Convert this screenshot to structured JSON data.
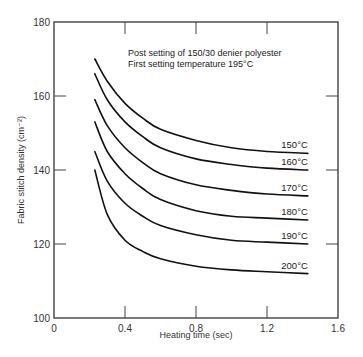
{
  "chart_data": {
    "type": "line",
    "title": "",
    "annotations": [
      "Post setting of 150/30 denier polyester",
      "First setting temperature 195°C"
    ],
    "xlabel": "Heating time (sec)",
    "ylabel": "Fabric stitch density (cm⁻²)",
    "xlim": [
      0,
      1.6
    ],
    "ylim": [
      100,
      180
    ],
    "xticks": [
      0,
      0.4,
      0.8,
      1.2,
      1.6
    ],
    "xtick_labels": [
      "0",
      "0.4",
      "0.8",
      "1.2",
      "1.6"
    ],
    "yticks": [
      100,
      120,
      140,
      160,
      180
    ],
    "ytick_labels": [
      "100",
      "120",
      "140",
      "160",
      "180"
    ],
    "grid": false,
    "legend": "inline labels at right end of each curve",
    "x": [
      0.23,
      0.3,
      0.4,
      0.5,
      0.6,
      0.8,
      1.0,
      1.2,
      1.43
    ],
    "series": [
      {
        "name": "150°C",
        "values": [
          170,
          164,
          158,
          154,
          151,
          148,
          146,
          145,
          144.5
        ]
      },
      {
        "name": "160°C",
        "values": [
          166,
          159,
          153,
          149,
          146,
          143,
          141.5,
          140.5,
          140
        ]
      },
      {
        "name": "170°C",
        "values": [
          159,
          152,
          146,
          142,
          139,
          136,
          134.5,
          133.5,
          133
        ]
      },
      {
        "name": "180°C",
        "values": [
          153,
          145,
          139,
          135,
          132,
          129,
          127.5,
          127,
          126.5
        ]
      },
      {
        "name": "190°C",
        "values": [
          145,
          137,
          131,
          127.5,
          125,
          122.5,
          121,
          120.5,
          120
        ]
      },
      {
        "name": "200°C",
        "values": [
          140,
          128,
          121,
          118,
          116,
          114,
          113,
          112.5,
          112
        ]
      }
    ]
  }
}
